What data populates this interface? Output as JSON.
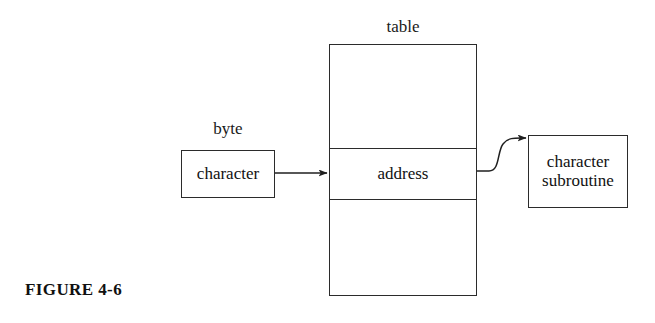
{
  "figure": {
    "caption": "FIGURE 4-6",
    "background_color": "#ffffff",
    "ink_color": "#1a1a1a"
  },
  "labels": {
    "byte": "byte",
    "table": "table"
  },
  "boxes": {
    "character_byte": {
      "text": "character",
      "label_above": "byte"
    },
    "character_subroutine": {
      "line1": "character",
      "line2": "subroutine",
      "text": "character\nsubroutine"
    }
  },
  "table": {
    "label": "table",
    "cells": [
      {
        "text": ""
      },
      {
        "text": "address"
      },
      {
        "text": ""
      }
    ]
  },
  "connectors": [
    {
      "name": "byte-to-table-arrow",
      "kind": "straight-arrow",
      "from": "character_byte",
      "to": "table.address_cell"
    },
    {
      "name": "table-to-subroutine-arrow",
      "kind": "curved-arrow",
      "from": "table.address_cell",
      "to": "character_subroutine"
    }
  ]
}
